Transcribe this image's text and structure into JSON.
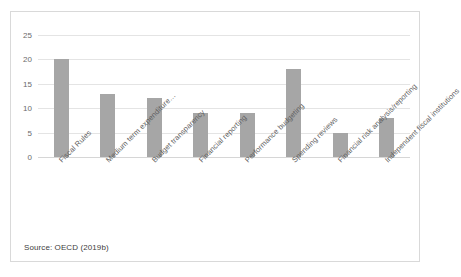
{
  "figure": {
    "source_note": "Source: OECD (2019b)"
  },
  "chart_data": {
    "type": "bar",
    "title": "",
    "xlabel": "",
    "ylabel": "",
    "ylim": [
      0,
      25
    ],
    "yticks": [
      0,
      5,
      10,
      15,
      20,
      25
    ],
    "grid": true,
    "legend": null,
    "bar_color": "#a6a6a6",
    "categories": [
      "Fiscal Rules",
      "Medium term expenditure…",
      "Budget transparency",
      "Financial reporting",
      "Performance budgeting",
      "Spending reviews",
      "Financial risk analysis/reporting",
      "Independent fiscal institutions"
    ],
    "values": [
      20,
      13,
      12,
      9,
      9,
      18,
      5,
      8
    ]
  }
}
